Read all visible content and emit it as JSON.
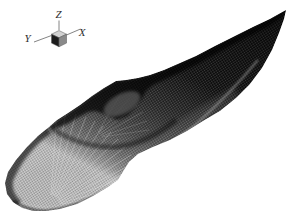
{
  "figure": {
    "style": "monochrome wireframe render on white background",
    "background_color": "#ffffff"
  },
  "axis_indicator": {
    "z_label": "Z",
    "y_label": "Y",
    "x_label": "X",
    "label_color": "#2e2e2e",
    "line_color": "#767676",
    "cube_top_color": "#d2d2d2",
    "cube_left_color": "#1c1c1c",
    "cube_right_color": "#8a8a8a"
  },
  "mesh_shading": {
    "darkest": "#0f0f0f",
    "dark": "#2b2b2b",
    "mid": "#484848",
    "light": "#6f6f6f",
    "lighter": "#a0a0a0",
    "lightest": "#c6c6c6",
    "fan_line_color": "#e6e6e6",
    "shadow_color": "#000000"
  }
}
